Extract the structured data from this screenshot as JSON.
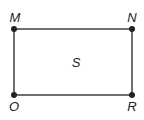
{
  "diagram": {
    "type": "rectangle",
    "region_label": "S",
    "vertices": [
      {
        "name": "M",
        "x": 14,
        "y": 29
      },
      {
        "name": "N",
        "x": 132,
        "y": 29
      },
      {
        "name": "R",
        "x": 132,
        "y": 95
      },
      {
        "name": "O",
        "x": 14,
        "y": 95
      }
    ],
    "colors": {
      "stroke": "#333333",
      "point": "#222222",
      "background": "#ffffff"
    }
  }
}
